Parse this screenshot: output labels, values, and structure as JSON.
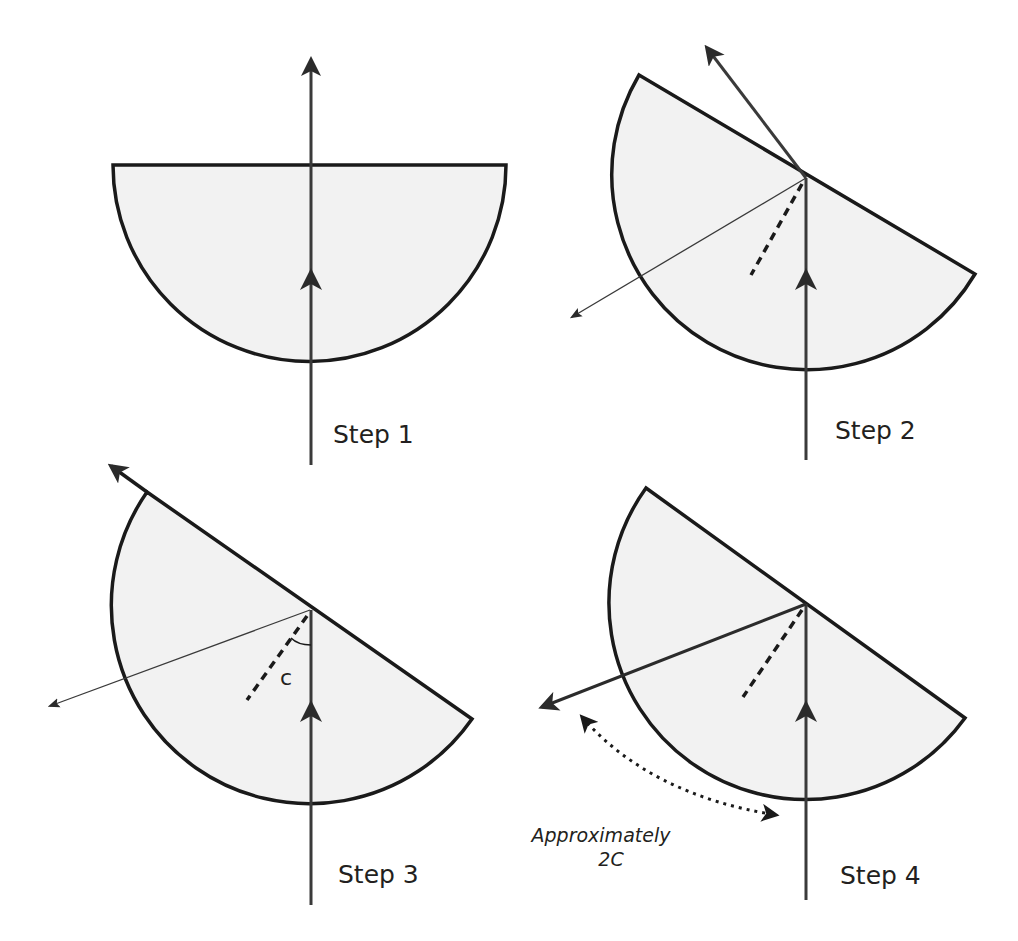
{
  "colors": {
    "stroke": "#1a1a1a",
    "ray": "#3a3a3a",
    "fill": "#f2f2f2",
    "background": "#ffffff"
  },
  "panels": [
    {
      "id": "step1",
      "label": "Step 1"
    },
    {
      "id": "step2",
      "label": "Step 2"
    },
    {
      "id": "step3",
      "label": "Step 3",
      "angle_label": "c"
    },
    {
      "id": "step4",
      "label": "Step 4",
      "annotation_line1": "Approximately",
      "annotation_line2": "2C"
    }
  ]
}
